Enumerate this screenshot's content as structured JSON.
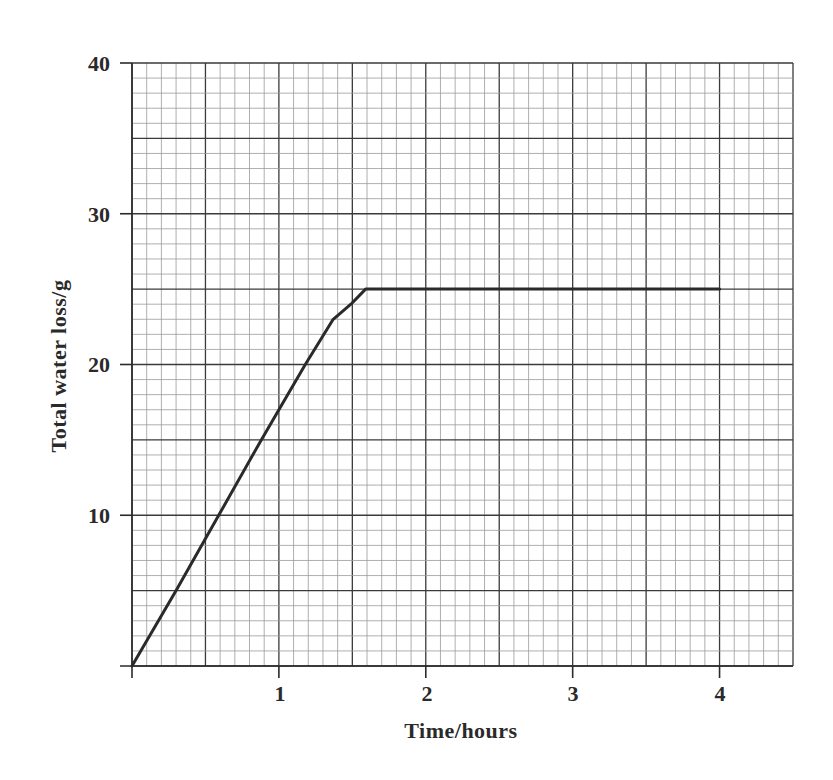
{
  "chart_data": {
    "type": "line",
    "title": "",
    "xlabel": "Time/hours",
    "ylabel": "Total water loss/g",
    "xlim": [
      0,
      4.5
    ],
    "ylim": [
      0,
      40
    ],
    "x_ticks": [
      1,
      2,
      3,
      4
    ],
    "y_ticks": [
      10,
      20,
      30,
      40
    ],
    "grid": {
      "on": true,
      "x_minor": 0.1,
      "x_major": 0.5,
      "y_minor": 1,
      "y_major": 5
    },
    "legend": null,
    "series": [
      {
        "name": "Total water loss",
        "x": [
          0,
          0.3,
          0.59,
          0.88,
          1.0,
          1.18,
          1.37,
          1.49,
          1.59,
          2.0,
          3.0,
          4.0
        ],
        "y": [
          0,
          5,
          10,
          15,
          17,
          20,
          23,
          24,
          25,
          25,
          25,
          25
        ],
        "color": "#2a2a2a"
      }
    ]
  },
  "labels": {
    "xlabel": "Time/hours",
    "ylabel": "Total water loss/g",
    "x_tick_1": "1",
    "x_tick_2": "2",
    "x_tick_3": "3",
    "x_tick_4": "4",
    "y_tick_10": "10",
    "y_tick_20": "20",
    "y_tick_30": "30",
    "y_tick_40": "40"
  }
}
